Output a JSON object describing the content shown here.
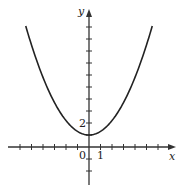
{
  "chart_data": {
    "type": "line",
    "title": "",
    "xlabel": "x",
    "ylabel": "y",
    "origin_label": "0",
    "x_tick_label": "1",
    "y_tick_label": "2",
    "x_ticks": [
      -6,
      -5,
      -4,
      -3,
      -2,
      -1,
      1,
      2,
      3,
      4,
      5,
      6
    ],
    "y_ticks": [
      -2,
      -1,
      1,
      2,
      3,
      4,
      5,
      6,
      7,
      8,
      9,
      10
    ],
    "xlim": [
      -7.5,
      7.5
    ],
    "ylim": [
      -2.7,
      11.5
    ],
    "grid": false,
    "series": [
      {
        "name": "curve",
        "description": "U-shaped curve symmetric about the y-axis with minimum at (0, 1)",
        "x": [
          -5.5,
          -5,
          -4,
          -3,
          -2,
          -1,
          0,
          1,
          2,
          3,
          4,
          5,
          5.5
        ],
        "y": [
          10.1,
          8.5,
          5.8,
          3.7,
          2.2,
          1.3,
          1,
          1.3,
          2.2,
          3.7,
          5.8,
          8.5,
          10.1
        ]
      }
    ],
    "colors": {
      "curve": "#222222",
      "axes": "#333333"
    }
  }
}
